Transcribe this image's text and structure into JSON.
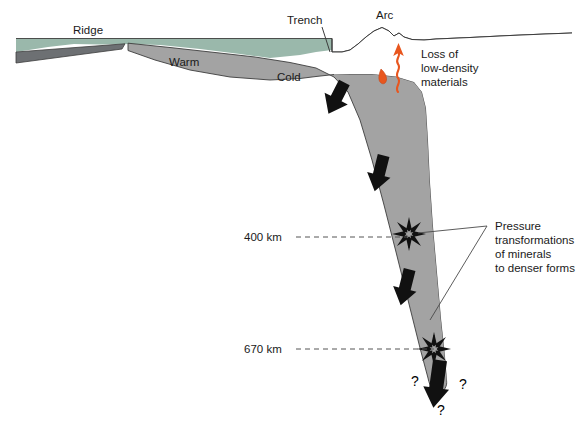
{
  "diagram": {
    "title_present": false,
    "labels": {
      "ridge": "Ridge",
      "trench": "Trench",
      "arc": "Arc",
      "warm": "Warm",
      "cold": "Cold",
      "loss_line1": "Loss of",
      "loss_line2": "low-density",
      "loss_line3": "materials",
      "depth_400": "400 km",
      "depth_670": "670 km",
      "pressure_line1": "Pressure",
      "pressure_line2": "transformations",
      "pressure_line3": "of minerals",
      "pressure_line4": "to denser forms",
      "question_left": "?",
      "question_right": "?",
      "question_bottom": "?"
    },
    "colors": {
      "water": "#9ab8ab",
      "slab": "#a3a3a3",
      "slab_dark": "#6d7073",
      "outline": "#3c3c3c",
      "magma": "#e8561e",
      "text": "#1a1a1a",
      "background": "#ffffff"
    },
    "annotations": {
      "depth_markers": [
        {
          "label": "400 km",
          "depth_km": 400
        },
        {
          "label": "670 km",
          "depth_km": 670
        }
      ],
      "burst_symbol_count": 2,
      "downward_arrow_count": 4,
      "magma_features": [
        "magma-blob",
        "wavy-rising-arrow"
      ]
    }
  }
}
